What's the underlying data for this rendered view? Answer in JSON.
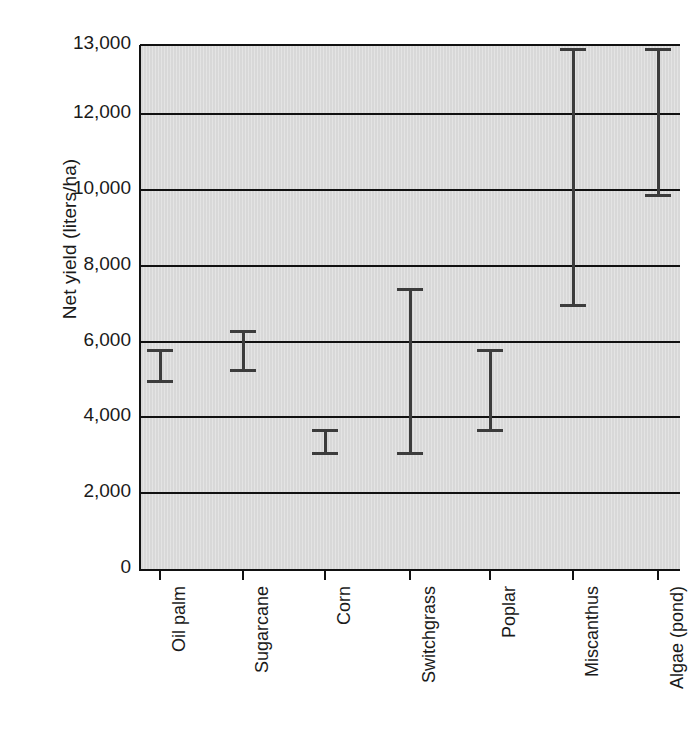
{
  "chart_data": {
    "type": "errorbar",
    "title": "",
    "xlabel": "",
    "ylabel": "Net yield (liters/ha)",
    "categories": [
      "Oil palm",
      "Sugarcane",
      "Corn",
      "Switchgrass",
      "Poplar",
      "Miscanthus",
      "Algae (pond)"
    ],
    "series": [
      {
        "name": "Net yield range",
        "low": [
          4900,
          5200,
          3000,
          3000,
          3600,
          6900,
          9800
        ],
        "high": [
          5800,
          6300,
          3700,
          7400,
          5800,
          12950,
          12950
        ]
      }
    ],
    "ylim": [
      0,
      13500
    ],
    "ytick_values": [
      0,
      2000,
      4000,
      6000,
      8000,
      10000,
      12000,
      13000
    ],
    "ytick_labels": [
      "0",
      "2,000",
      "4,000",
      "6,000",
      "8,000",
      "10,000",
      "12,000",
      "13,000"
    ],
    "grid": "horizontal",
    "legend": "none",
    "plot_background": "#d8d8d8",
    "line_color": "#3c3c3c",
    "axis_color": "#111111"
  }
}
